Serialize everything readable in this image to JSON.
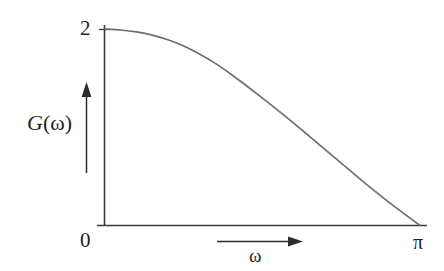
{
  "figure": {
    "background_color": "#ffffff",
    "curve_color": "#6e6e6e",
    "axis_color": "#3a3a3a",
    "text_color": "#1f1f1f"
  },
  "labels": {
    "y_max": "2",
    "origin": "0",
    "x_max": "π",
    "y_axis_title_g": "G",
    "y_axis_title_open": "(",
    "y_axis_title_omega": "ω",
    "y_axis_title_close": ")",
    "x_axis_title": "ω"
  },
  "chart_data": {
    "type": "line",
    "title": "",
    "xlabel": "ω",
    "ylabel": "G(ω)",
    "xlim": [
      0,
      3.141592653589793
    ],
    "ylim": [
      0,
      2
    ],
    "xticks": [
      0,
      3.141592653589793
    ],
    "xticklabels": [
      "0",
      "π"
    ],
    "yticks": [
      0,
      2
    ],
    "yticklabels": [
      "0",
      "2"
    ],
    "grid": false,
    "legend": false,
    "series": [
      {
        "name": "G(ω)",
        "color": "#6e6e6e",
        "linewidth": 1.7,
        "x": [
          0.0,
          0.157,
          0.314,
          0.471,
          0.628,
          0.785,
          0.942,
          1.1,
          1.257,
          1.414,
          1.571,
          1.728,
          1.885,
          2.042,
          2.199,
          2.356,
          2.513,
          2.67,
          2.827,
          2.985,
          3.142
        ],
        "y": [
          2.0,
          1.99,
          1.97,
          1.938,
          1.89,
          1.826,
          1.745,
          1.65,
          1.54,
          1.42,
          1.297,
          1.17,
          1.04,
          0.905,
          0.77,
          0.634,
          0.5,
          0.368,
          0.24,
          0.118,
          0.0
        ]
      }
    ],
    "annotations": [
      {
        "name": "y-axis-direction-arrow",
        "kind": "arrow",
        "direction": "up",
        "x": 0.0,
        "from_y": 0.72,
        "to_y": 1.62
      },
      {
        "name": "x-axis-direction-arrow",
        "kind": "arrow",
        "direction": "right",
        "y": -0.16,
        "from_x": 1.05,
        "to_x": 2.0
      }
    ]
  }
}
